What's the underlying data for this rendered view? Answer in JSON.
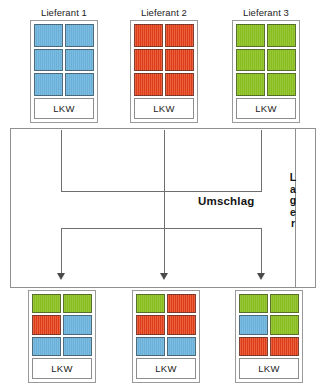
{
  "diagram": {
    "title_hub": "Umschlag",
    "side_label": "Lager",
    "side_label_letters": [
      "L",
      "a",
      "g",
      "e",
      "r"
    ],
    "vehicle_label": "LKW",
    "colors": {
      "blue": "#6cb4dc",
      "red": "#e8401a",
      "green": "#8cc220",
      "frame": "#9a9a9a",
      "line": "#6f6f6f",
      "text": "#151515"
    }
  },
  "inbound": [
    {
      "label": "Lieferant 1",
      "vehicle": "LKW",
      "cells": [
        "blue",
        "blue",
        "blue",
        "blue",
        "blue",
        "blue"
      ]
    },
    {
      "label": "Lieferant 2",
      "vehicle": "LKW",
      "cells": [
        "red",
        "red",
        "red",
        "red",
        "red",
        "red"
      ]
    },
    {
      "label": "Lieferant 3",
      "vehicle": "LKW",
      "cells": [
        "green",
        "green",
        "green",
        "green",
        "green",
        "green"
      ]
    }
  ],
  "outbound": [
    {
      "label": "",
      "vehicle": "LKW",
      "cells": [
        "green",
        "green",
        "red",
        "blue",
        "blue",
        "blue"
      ]
    },
    {
      "label": "",
      "vehicle": "LKW",
      "cells": [
        "green",
        "red",
        "red",
        "red",
        "blue",
        "blue"
      ]
    },
    {
      "label": "",
      "vehicle": "LKW",
      "cells": [
        "green",
        "green",
        "blue",
        "green",
        "red",
        "red"
      ]
    }
  ]
}
